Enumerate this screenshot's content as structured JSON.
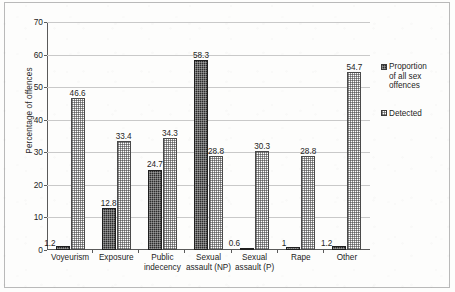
{
  "chart_data": {
    "type": "bar",
    "title": "",
    "xlabel": "",
    "ylabel": "Percentage of offences",
    "ylim": [
      0,
      70
    ],
    "ytick_step": 10,
    "yticks": [
      "0",
      "10",
      "20",
      "30",
      "40",
      "50",
      "60",
      "70"
    ],
    "grid": "horizontal",
    "legend_position": "right",
    "categories": [
      "Voyeurism",
      "Exposure",
      "Public indecency",
      "Sexual assault (NP)",
      "Sexual assault (P)",
      "Rape",
      "Other"
    ],
    "category_lines": [
      [
        "Voyeurism"
      ],
      [
        "Exposure"
      ],
      [
        "Public",
        "indecency"
      ],
      [
        "Sexual",
        "assault (NP)"
      ],
      [
        "Sexual",
        "assault (P)"
      ],
      [
        "Rape"
      ],
      [
        "Other"
      ]
    ],
    "series": [
      {
        "name": "Proportion of all sex offences",
        "name_lines": [
          "Proportion",
          "of all sex",
          "offences"
        ],
        "pattern": "dark-checker",
        "color": "#2c2c2c",
        "values": [
          1.2,
          12.8,
          24.7,
          58.3,
          0.6,
          1,
          1.2
        ],
        "labels": [
          "1.2",
          "12.8",
          "24.7",
          "58.3",
          "0.6",
          "1",
          "1.2"
        ]
      },
      {
        "name": "Detected",
        "name_lines": [
          "Detected"
        ],
        "pattern": "light-dotted",
        "color": "#ffffff",
        "values": [
          46.6,
          33.4,
          34.3,
          28.8,
          30.3,
          28.8,
          54.7
        ],
        "labels": [
          "46.6",
          "33.4",
          "34.3",
          "28.8",
          "30.3",
          "28.8",
          "54.7"
        ]
      }
    ]
  }
}
